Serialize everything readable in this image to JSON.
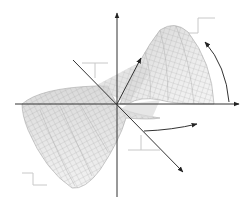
{
  "figure": {
    "description": "3D twisted saddle surface with mesh grid, coordinate axes and rotation arrows",
    "colors": {
      "background": "#ffffff",
      "axis": "#333333",
      "mesh_line": "#8a8a8a",
      "surface_fill": "#e6e6e6",
      "surface_shade": "#cfcfcf",
      "guide": "#c8c8c8"
    },
    "axes": [
      {
        "name": "vertical-axis",
        "x1": 117,
        "y1": 197,
        "x2": 117,
        "y2": 12
      },
      {
        "name": "horizontal-axis",
        "x1": 15,
        "y1": 104,
        "x2": 240,
        "y2": 104
      },
      {
        "name": "diagonal-axis",
        "x1": 73,
        "y1": 60,
        "x2": 184,
        "y2": 173
      }
    ],
    "arrows": [
      {
        "name": "tilt-arrow",
        "path": "M117,104 L141,58"
      },
      {
        "name": "rotation-arrow-right",
        "path": "M229,102 Q226,66 205,42"
      },
      {
        "name": "rotation-arrow-bottom",
        "path": "M144,131 Q172,130 197,124"
      }
    ],
    "guides": [
      {
        "name": "step-guide-top-right",
        "points": "188,33 198,33 198,18 215,18"
      },
      {
        "name": "step-guide-upper-left",
        "points": "82,63 108,63 M95,63 95,78"
      },
      {
        "name": "step-guide-bottom-left",
        "points": "22,173 33,173 33,185 47,185"
      },
      {
        "name": "step-guide-bottom-center",
        "points": "128,150 160,150 M141,135 141,150"
      }
    ]
  }
}
